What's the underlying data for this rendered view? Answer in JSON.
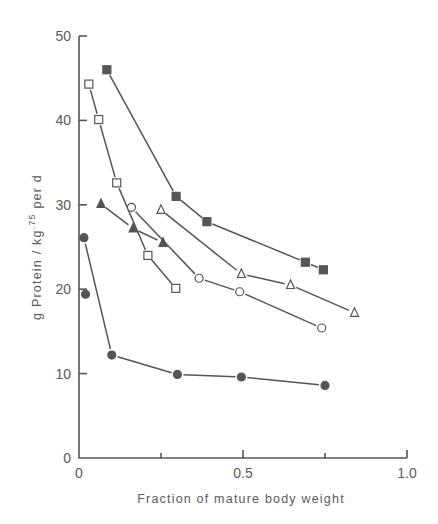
{
  "chart_data": {
    "type": "scatter",
    "title": "",
    "xlabel": "Fraction of mature body weight",
    "ylabel": "g Protein / kg.75 per d",
    "ylabel_parts": {
      "main": "g Protein / kg",
      "sup": ".75",
      "tail": " per d"
    },
    "xlim": [
      0,
      1.0
    ],
    "ylim": [
      0,
      50
    ],
    "x_ticks": [
      0,
      0.25,
      0.5,
      0.75,
      1.0
    ],
    "x_tick_labels": [
      "0",
      "",
      "0.5",
      "",
      "1.0"
    ],
    "y_ticks": [
      0,
      10,
      20,
      30,
      40,
      50
    ],
    "y_tick_labels": [
      "0",
      "10",
      "20",
      "30",
      "40",
      "50"
    ],
    "grid": false,
    "legend": null,
    "series": [
      {
        "name": "filled-square",
        "marker": "square",
        "filled": true,
        "points": [
          [
            0.085,
            46.0
          ],
          [
            0.296,
            31.0
          ],
          [
            0.39,
            28.0
          ],
          [
            0.69,
            23.2
          ],
          [
            0.745,
            22.3
          ]
        ],
        "segments": [
          [
            0,
            1
          ],
          [
            1,
            2
          ],
          [
            2,
            3
          ],
          [
            3,
            4
          ]
        ]
      },
      {
        "name": "open-square",
        "marker": "square",
        "filled": false,
        "points": [
          [
            0.03,
            44.3
          ],
          [
            0.06,
            40.1
          ],
          [
            0.115,
            32.6
          ],
          [
            0.21,
            24.0
          ],
          [
            0.295,
            20.1
          ]
        ],
        "segments": [
          [
            0,
            1
          ],
          [
            1,
            2
          ],
          [
            2,
            3
          ],
          [
            3,
            4
          ]
        ]
      },
      {
        "name": "filled-triangle",
        "marker": "triangle",
        "filled": true,
        "points": [
          [
            0.067,
            30.1
          ],
          [
            0.165,
            27.2
          ],
          [
            0.256,
            25.5
          ]
        ],
        "segments": [
          [
            0,
            1
          ],
          [
            1,
            2
          ]
        ]
      },
      {
        "name": "open-circle",
        "marker": "circle",
        "filled": false,
        "points": [
          [
            0.16,
            29.7
          ],
          [
            0.366,
            21.3
          ],
          [
            0.49,
            19.7
          ],
          [
            0.74,
            15.4
          ]
        ],
        "segments": [
          [
            0,
            1
          ],
          [
            1,
            2
          ],
          [
            2,
            3
          ]
        ]
      },
      {
        "name": "open-triangle",
        "marker": "triangle",
        "filled": false,
        "points": [
          [
            0.25,
            29.4
          ],
          [
            0.495,
            21.8
          ],
          [
            0.645,
            20.5
          ],
          [
            0.84,
            17.2
          ]
        ],
        "segments": [
          [
            0,
            1
          ],
          [
            1,
            2
          ],
          [
            2,
            3
          ]
        ]
      },
      {
        "name": "filled-circle",
        "marker": "circle",
        "filled": true,
        "points": [
          [
            0.015,
            26.1
          ],
          [
            0.02,
            19.4
          ],
          [
            0.1,
            12.2
          ],
          [
            0.3,
            9.9
          ],
          [
            0.495,
            9.6
          ],
          [
            0.75,
            8.6
          ]
        ],
        "segments": [
          [
            0,
            2
          ],
          [
            2,
            3
          ],
          [
            3,
            4
          ],
          [
            4,
            5
          ]
        ]
      }
    ]
  },
  "style": {
    "ink_color": "#555555",
    "background": "#ffffff"
  }
}
